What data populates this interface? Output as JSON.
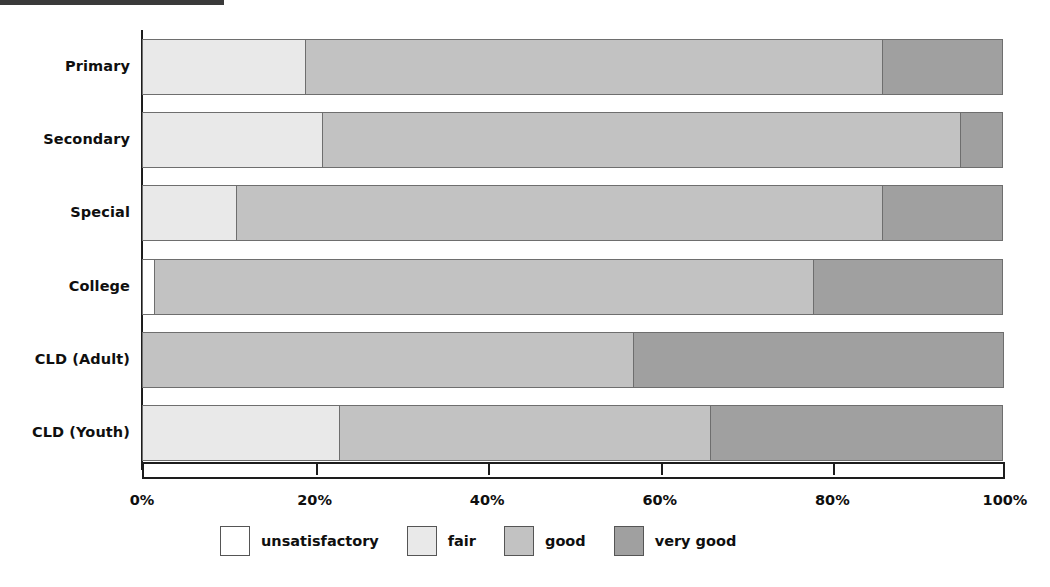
{
  "chart_data": {
    "type": "bar",
    "orientation": "horizontal",
    "stacked": true,
    "normalized": true,
    "title": "",
    "subtitle": "",
    "xlabel": "",
    "ylabel": "",
    "xlim": [
      0,
      100
    ],
    "grid": false,
    "legend_position": "bottom",
    "categories": [
      "Primary",
      "Secondary",
      "Special",
      "College",
      "CLD (Adult)",
      "CLD (Youth)"
    ],
    "x_tick_values": [
      0,
      20,
      40,
      60,
      80,
      100
    ],
    "x_tick_labels": [
      "0%",
      "20%",
      "40%",
      "60%",
      "80%",
      "100%"
    ],
    "series": [
      {
        "name": "unsatisfactory",
        "color": "#ffffff",
        "values": [
          0,
          0,
          0,
          1.5,
          0,
          0
        ]
      },
      {
        "name": "fair",
        "color": "#e9e9e9",
        "values": [
          19,
          21,
          11,
          0,
          0,
          23
        ]
      },
      {
        "name": "good",
        "color": "#c2c2c2",
        "values": [
          67,
          74,
          75,
          76.5,
          57,
          43
        ]
      },
      {
        "name": "very good",
        "color": "#a0a0a0",
        "values": [
          14,
          5,
          14,
          22,
          43,
          34
        ]
      }
    ],
    "legend_entries": [
      {
        "label": "unsatisfactory",
        "color": "#ffffff"
      },
      {
        "label": "fair",
        "color": "#e9e9e9"
      },
      {
        "label": "good",
        "color": "#c2c2c2"
      },
      {
        "label": "very good",
        "color": "#a0a0a0"
      }
    ]
  }
}
